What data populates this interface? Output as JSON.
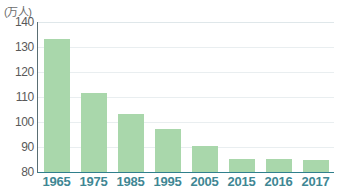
{
  "chart_data": {
    "type": "bar",
    "title": "",
    "subtitle": "",
    "xlabel": "",
    "ylabel": "(万人)",
    "unit_caption": "(万人)",
    "categories": [
      "1965",
      "1975",
      "1985",
      "1995",
      "2005",
      "2015",
      "2016",
      "2017"
    ],
    "values": [
      133.2,
      111.5,
      103.3,
      97.4,
      90.5,
      85.4,
      85.4,
      84.8
    ],
    "series": [
      {
        "name": "",
        "values": [
          133.2,
          111.5,
          103.3,
          97.4,
          90.5,
          85.4,
          85.4,
          84.8
        ]
      }
    ],
    "ylim": [
      80,
      140
    ],
    "yticks": [
      140,
      130,
      120,
      110,
      100,
      90,
      80
    ],
    "ytick_labels": [
      "140",
      "130",
      "120",
      "110",
      "100",
      "90",
      "80"
    ],
    "grid": true,
    "legend": false,
    "legend_position": "none",
    "bar_color": "#a9d7ab",
    "ytick_color": "#595959",
    "xtick_color": "#3f8794",
    "unit_color": "#6c6c6c",
    "gridline_color": "#e9eef0",
    "axis_color": "#5a6e73",
    "baseline_color": "#2f7f8c",
    "background_color": "#ffffff"
  }
}
